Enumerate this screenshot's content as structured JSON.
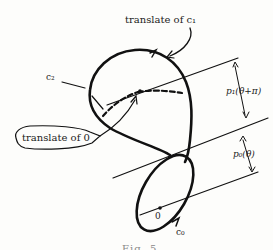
{
  "figure": {
    "labels": {
      "translate_c1": "translate of c₁",
      "c2": "c₂",
      "translate_0": "translate of 0",
      "p1": "p₁(θ+π)",
      "p0": "p₀(θ)",
      "origin": "0",
      "c0": "c₀"
    },
    "caption": "Fig. 5"
  }
}
